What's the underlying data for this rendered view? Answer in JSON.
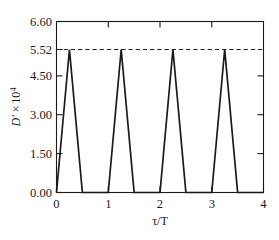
{
  "chart_data": {
    "type": "line",
    "title": "",
    "subtitle": "",
    "xlabel": "τ/T",
    "ylabel_parts": {
      "symbol": "D′",
      "times": "×",
      "base": "10",
      "exponent": "4"
    },
    "ylabel": "D′ × 10⁴",
    "xlim": [
      0,
      4
    ],
    "ylim": [
      0,
      6.6
    ],
    "xticks": [
      0,
      1,
      2,
      3,
      4
    ],
    "xticklabels": [
      "0",
      "1",
      "2",
      "3",
      "4"
    ],
    "yticks": [
      0.0,
      1.5,
      3.0,
      4.5,
      5.52,
      6.6
    ],
    "yticklabels": [
      "0.00",
      "1.50",
      "3.00",
      "4.50",
      "5.52",
      "6.60"
    ],
    "grid": false,
    "legend": null,
    "legend_position": "none",
    "series": [
      {
        "name": "D′",
        "color": "#1a1a1a",
        "linestyle": "solid",
        "x": [
          0.0,
          0.25,
          0.5,
          1.0,
          1.25,
          1.5,
          2.0,
          2.25,
          2.5,
          3.0,
          3.25,
          3.5,
          4.0
        ],
        "y": [
          0.0,
          5.52,
          0.0,
          0.0,
          5.52,
          0.0,
          0.0,
          5.52,
          0.0,
          0.0,
          5.52,
          0.0,
          0.0
        ]
      }
    ],
    "annotations": [
      {
        "type": "hline",
        "name": "peak-reference-line",
        "value": 5.52,
        "linestyle": "dashed",
        "color": "#1a1a1a"
      }
    ],
    "peaks": {
      "value": 5.52,
      "positions": [
        0.25,
        1.25,
        2.25,
        3.25
      ],
      "period": 1.0,
      "count": 4
    }
  },
  "caption": {
    "fragment": ""
  }
}
